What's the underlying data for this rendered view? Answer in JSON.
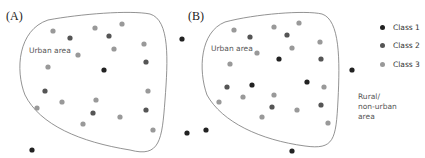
{
  "panels": [
    {
      "id": "A",
      "label": "(A)",
      "area_label": "Urban area",
      "outline": "M 48 20 C 80 14 130 10 150 14 C 170 20 168 60 165 100 C 162 140 160 158 130 150 C 80 142 40 125 25 95 C 15 70 18 30 48 20 Z",
      "dots": [
        {
          "x": 53,
          "y": 31,
          "class": 3
        },
        {
          "x": 95,
          "y": 28,
          "class": 3
        },
        {
          "x": 122,
          "y": 24,
          "class": 3
        },
        {
          "x": 144,
          "y": 44,
          "class": 3
        },
        {
          "x": 114,
          "y": 49,
          "class": 3
        },
        {
          "x": 78,
          "y": 55,
          "class": 3
        },
        {
          "x": 48,
          "y": 67,
          "class": 3
        },
        {
          "x": 148,
          "y": 91,
          "class": 3
        },
        {
          "x": 37,
          "y": 108,
          "class": 3
        },
        {
          "x": 62,
          "y": 102,
          "class": 3
        },
        {
          "x": 96,
          "y": 100,
          "class": 3
        },
        {
          "x": 120,
          "y": 117,
          "class": 3
        },
        {
          "x": 83,
          "y": 124,
          "class": 3
        },
        {
          "x": 153,
          "y": 130,
          "class": 3
        },
        {
          "x": 70,
          "y": 38,
          "class": 2
        },
        {
          "x": 109,
          "y": 36,
          "class": 2
        },
        {
          "x": 146,
          "y": 62,
          "class": 2
        },
        {
          "x": 45,
          "y": 91,
          "class": 2
        },
        {
          "x": 146,
          "y": 110,
          "class": 2
        },
        {
          "x": 93,
          "y": 113,
          "class": 2
        },
        {
          "x": 104,
          "y": 70,
          "class": 1
        },
        {
          "x": 32,
          "y": 150,
          "class": 1
        }
      ]
    },
    {
      "id": "B",
      "label": "(B)",
      "area_label": "Urban area",
      "outline": "M 225 22 C 255 14 305 10 322 14 C 340 20 340 60 338 100 C 336 140 334 150 305 146 C 260 140 222 122 207 95 C 198 70 200 32 225 22 Z",
      "dots": [
        {
          "x": 234,
          "y": 30,
          "class": 3
        },
        {
          "x": 274,
          "y": 27,
          "class": 3
        },
        {
          "x": 299,
          "y": 23,
          "class": 3
        },
        {
          "x": 320,
          "y": 42,
          "class": 3
        },
        {
          "x": 292,
          "y": 48,
          "class": 3
        },
        {
          "x": 257,
          "y": 53,
          "class": 3
        },
        {
          "x": 230,
          "y": 64,
          "class": 3
        },
        {
          "x": 324,
          "y": 87,
          "class": 3
        },
        {
          "x": 219,
          "y": 102,
          "class": 3
        },
        {
          "x": 243,
          "y": 97,
          "class": 3
        },
        {
          "x": 274,
          "y": 95,
          "class": 3
        },
        {
          "x": 297,
          "y": 110,
          "class": 3
        },
        {
          "x": 262,
          "y": 117,
          "class": 3
        },
        {
          "x": 328,
          "y": 123,
          "class": 3
        },
        {
          "x": 250,
          "y": 37,
          "class": 2
        },
        {
          "x": 287,
          "y": 35,
          "class": 2
        },
        {
          "x": 321,
          "y": 59,
          "class": 2
        },
        {
          "x": 227,
          "y": 87,
          "class": 2
        },
        {
          "x": 321,
          "y": 105,
          "class": 2
        },
        {
          "x": 272,
          "y": 107,
          "class": 2
        },
        {
          "x": 279,
          "y": 59,
          "class": 1
        },
        {
          "x": 252,
          "y": 85,
          "class": 1
        },
        {
          "x": 307,
          "y": 82,
          "class": 1
        },
        {
          "x": 182,
          "y": 39,
          "class": 1
        },
        {
          "x": 352,
          "y": 70,
          "class": 1
        },
        {
          "x": 187,
          "y": 133,
          "class": 1
        },
        {
          "x": 206,
          "y": 130,
          "class": 1
        },
        {
          "x": 292,
          "y": 151,
          "class": 1
        }
      ]
    }
  ],
  "rural_label": "Rural/\nnon-urban\narea",
  "legend": [
    {
      "label": "Class 1",
      "color": "#222222"
    },
    {
      "label": "Class 2",
      "color": "#555555"
    },
    {
      "label": "Class 3",
      "color": "#999999"
    }
  ],
  "colors": {
    "outline": "#777777",
    "class1": "#222222",
    "class2": "#555555",
    "class3": "#999999"
  }
}
